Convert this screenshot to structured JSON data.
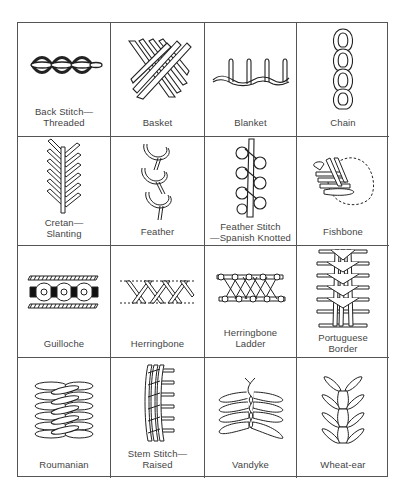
{
  "figure": {
    "stitches": [
      {
        "label": "Back Stitch—\nThreaded",
        "icon": "back-stitch-threaded-icon"
      },
      {
        "label": "Basket",
        "icon": "basket-stitch-icon"
      },
      {
        "label": "Blanket",
        "icon": "blanket-stitch-icon"
      },
      {
        "label": "Chain",
        "icon": "chain-stitch-icon"
      },
      {
        "label": "Cretan—\nSlanting",
        "icon": "cretan-slanting-stitch-icon"
      },
      {
        "label": "Feather",
        "icon": "feather-stitch-icon"
      },
      {
        "label": "Feather Stitch\n—Spanish Knotted",
        "icon": "feather-spanish-knotted-stitch-icon"
      },
      {
        "label": "Fishbone",
        "icon": "fishbone-stitch-icon"
      },
      {
        "label": "Guilloche",
        "icon": "guilloche-stitch-icon"
      },
      {
        "label": "Herringbone",
        "icon": "herringbone-stitch-icon"
      },
      {
        "label": "Herringbone\nLadder",
        "icon": "herringbone-ladder-stitch-icon"
      },
      {
        "label": "Portuguese\nBorder",
        "icon": "portuguese-border-stitch-icon"
      },
      {
        "label": "Roumanian",
        "icon": "roumanian-stitch-icon"
      },
      {
        "label": "Stem Stitch—\nRaised",
        "icon": "stem-stitch-raised-icon"
      },
      {
        "label": "Vandyke",
        "icon": "vandyke-stitch-icon"
      },
      {
        "label": "Wheat-ear",
        "icon": "wheat-ear-stitch-icon"
      }
    ]
  }
}
